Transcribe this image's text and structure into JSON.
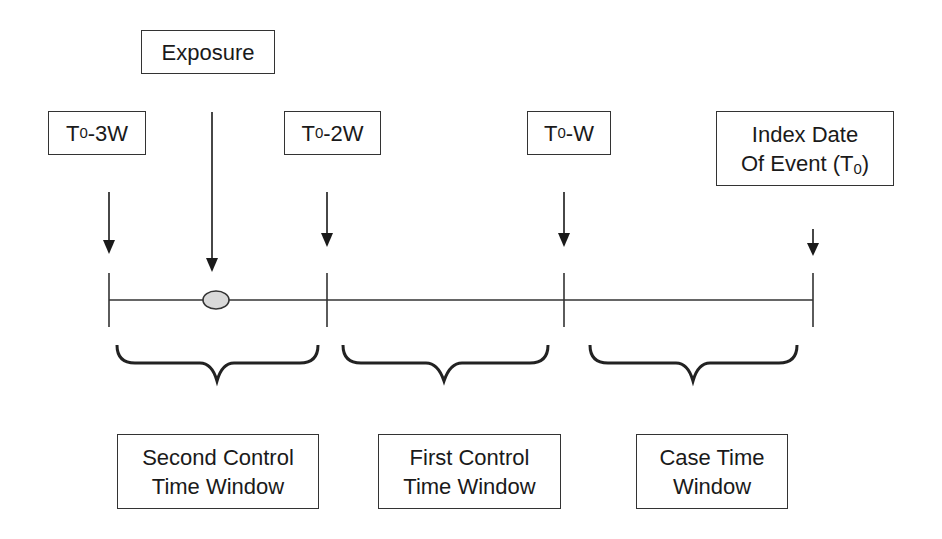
{
  "diagram": {
    "top_labels": {
      "exposure": "Exposure",
      "t0_3w": {
        "prefix": "T",
        "sub": "0",
        "suffix": "-3W"
      },
      "t0_2w": {
        "prefix": "T",
        "sub": "0",
        "suffix": "-2W"
      },
      "t0_w": {
        "prefix": "T",
        "sub": "0",
        "suffix": "-W"
      },
      "index_date": {
        "line1": "Index Date",
        "line2_prefix": "Of Event (T",
        "line2_sub": "0",
        "line2_suffix": ")"
      }
    },
    "timeline": {
      "ticks": [
        "T0-3W",
        "T0-2W",
        "T0-W",
        "T0"
      ],
      "exposure_marker": "ellipse",
      "marker_fill": "#d9d9d9",
      "line_color": "#333333"
    },
    "windows": [
      {
        "line1": "Second Control",
        "line2": "Time Window"
      },
      {
        "line1": "First Control",
        "line2": "Time Window"
      },
      {
        "line1": "Case Time",
        "line2": "Window"
      }
    ]
  }
}
